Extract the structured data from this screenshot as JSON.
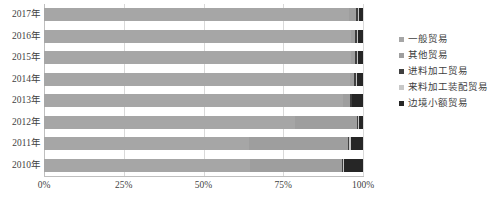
{
  "chart_data": {
    "type": "bar",
    "subtype": "stacked-horizontal-100pct",
    "title": "",
    "xlabel": "",
    "ylabel": "",
    "orientation": "horizontal",
    "stacked": true,
    "normalized": true,
    "grid": true,
    "legend_position": "right",
    "xlim": [
      0,
      100
    ],
    "xticks": [
      0,
      25,
      50,
      75,
      100
    ],
    "xticklabels": [
      "0%",
      "25%",
      "50%",
      "75%",
      "100%"
    ],
    "categories": [
      "2010年",
      "2011年",
      "2012年",
      "2013年",
      "2014年",
      "2015年",
      "2016年",
      "2017年"
    ],
    "categories_top_to_bottom": [
      "2017年",
      "2016年",
      "2015年",
      "2014年",
      "2013年",
      "2012年",
      "2011年",
      "2010年"
    ],
    "series": [
      {
        "name": "一般贸易",
        "color": "#A6A6A6",
        "values": [
          64.6,
          64.2,
          78.7,
          93.7,
          95.8,
          96.2,
          96.3,
          95.6
        ]
      },
      {
        "name": "其他贸易",
        "color": "#9E9E9E",
        "values": [
          28.7,
          31.0,
          19.3,
          2.2,
          1.4,
          1.2,
          1.3,
          2.2
        ]
      },
      {
        "name": "进料加工贸易",
        "color": "#3F3F3F",
        "values": [
          0.4,
          0.5,
          0.4,
          0.5,
          0.5,
          0.6,
          0.6,
          0.5
        ]
      },
      {
        "name": "来料加工装配贸易",
        "color": "#C8C8C8",
        "values": [
          0.4,
          0.4,
          0.3,
          0.3,
          0.3,
          0.3,
          0.3,
          0.3
        ]
      },
      {
        "name": "边境小额贸易",
        "color": "#262626",
        "values": [
          5.9,
          3.9,
          1.3,
          3.3,
          2.0,
          1.7,
          1.5,
          1.4
        ]
      }
    ]
  },
  "legend": {
    "items": [
      {
        "label": "一般贸易",
        "color": "#A6A6A6"
      },
      {
        "label": "其他贸易",
        "color": "#9E9E9E"
      },
      {
        "label": "进料加工贸易",
        "color": "#3F3F3F"
      },
      {
        "label": "来料加工装配贸易",
        "color": "#C8C8C8"
      },
      {
        "label": "边境小额贸易",
        "color": "#262626"
      }
    ]
  }
}
